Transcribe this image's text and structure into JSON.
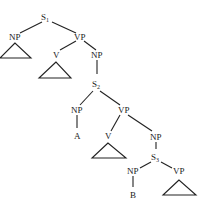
{
  "tree": {
    "nodes": {
      "s1": {
        "label": "S",
        "sub": "1"
      },
      "np1": {
        "label": "NP"
      },
      "vp1": {
        "label": "VP"
      },
      "v1": {
        "label": "V"
      },
      "np2": {
        "label": "NP"
      },
      "s2": {
        "label": "S",
        "sub": "2"
      },
      "np3": {
        "label": "NP"
      },
      "a": {
        "label": "A"
      },
      "vp2": {
        "label": "VP"
      },
      "v2": {
        "label": "V"
      },
      "np4": {
        "label": "NP"
      },
      "s3": {
        "label": "S",
        "sub": "3"
      },
      "np5": {
        "label": "NP"
      },
      "b": {
        "label": "B"
      },
      "vp3": {
        "label": "VP"
      }
    }
  }
}
